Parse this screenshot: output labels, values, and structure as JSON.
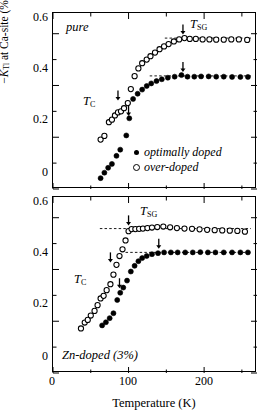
{
  "figure": {
    "ylabel_prefix": "−",
    "ylabel_k": "K",
    "ylabel_sub": "Tl",
    "ylabel_rest": " at Ca-site (%)",
    "xtitle": "Temperature (K)",
    "yticks": [
      "0",
      "0.2",
      "0.4",
      "0.6"
    ],
    "xticks": [
      "0",
      "100",
      "200"
    ],
    "legend": [
      {
        "marker": "filled-circle",
        "label": "optimally doped"
      },
      {
        "marker": "open-circle",
        "label": "over-doped"
      }
    ],
    "annotation_tc": "T",
    "annotation_tc_sub": "C",
    "annotation_tsg": "T",
    "annotation_tsg_sub": "SG"
  },
  "chart_data": [
    {
      "type": "scatter",
      "panel": "top",
      "title": "pure",
      "xlabel": "Temperature (K)",
      "ylabel": "-K_Tl at Ca-site (%)",
      "xlim": [
        0,
        270
      ],
      "ylim": [
        0,
        0.68
      ],
      "grid": false,
      "legend_position": "lower-right",
      "annotations": [
        {
          "text": "T_C",
          "series": "over-doped",
          "x": 86,
          "y": 0.33,
          "arrow": "down"
        },
        {
          "text": "T_C",
          "series": "optimally doped",
          "x": 100,
          "y": 0.27,
          "arrow": "down"
        },
        {
          "text": "T_SG",
          "series": "over-doped",
          "x": 172,
          "y": 0.585,
          "arrow": "down"
        },
        {
          "text": "T_SG",
          "series": "optimally doped",
          "x": 172,
          "y": 0.44,
          "arrow": "down"
        }
      ],
      "reference_lines": [
        {
          "series": "over-doped",
          "y": 0.583,
          "x_from": 148,
          "x_to": 262,
          "style": "dashed"
        },
        {
          "series": "optimally doped",
          "y": 0.437,
          "x_from": 128,
          "x_to": 262,
          "style": "dashed"
        }
      ],
      "series": [
        {
          "name": "optimally doped",
          "marker": "filled-circle",
          "points": [
            [
              63,
              0.042
            ],
            [
              68,
              0.063
            ],
            [
              73,
              0.082
            ],
            [
              78,
              0.097
            ],
            [
              84,
              0.128
            ],
            [
              89,
              0.152
            ],
            [
              97,
              0.207
            ],
            [
              101,
              0.273
            ],
            [
              106,
              0.348
            ],
            [
              112,
              0.368
            ],
            [
              118,
              0.384
            ],
            [
              124,
              0.398
            ],
            [
              130,
              0.408
            ],
            [
              137,
              0.417
            ],
            [
              144,
              0.424
            ],
            [
              152,
              0.43
            ],
            [
              161,
              0.434
            ],
            [
              170,
              0.44
            ],
            [
              178,
              0.434
            ],
            [
              187,
              0.434
            ],
            [
              196,
              0.435
            ],
            [
              206,
              0.435
            ],
            [
              216,
              0.434
            ],
            [
              226,
              0.434
            ],
            [
              237,
              0.433
            ],
            [
              248,
              0.433
            ],
            [
              258,
              0.433
            ]
          ]
        },
        {
          "name": "over-doped",
          "marker": "open-circle",
          "points": [
            [
              63,
              0.191
            ],
            [
              68,
              0.205
            ],
            [
              74,
              0.258
            ],
            [
              78,
              0.268
            ],
            [
              82,
              0.284
            ],
            [
              86,
              0.296
            ],
            [
              90,
              0.3
            ],
            [
              94,
              0.312
            ],
            [
              99,
              0.332
            ],
            [
              103,
              0.386
            ],
            [
              108,
              0.436
            ],
            [
              113,
              0.466
            ],
            [
              118,
              0.486
            ],
            [
              124,
              0.5
            ],
            [
              129,
              0.513
            ],
            [
              135,
              0.527
            ],
            [
              141,
              0.54
            ],
            [
              147,
              0.551
            ],
            [
              153,
              0.56
            ],
            [
              160,
              0.57
            ],
            [
              167,
              0.578
            ],
            [
              174,
              0.583
            ],
            [
              181,
              0.58
            ],
            [
              189,
              0.58
            ],
            [
              198,
              0.578
            ],
            [
              207,
              0.578
            ],
            [
              216,
              0.577
            ],
            [
              226,
              0.577
            ],
            [
              236,
              0.578
            ],
            [
              246,
              0.578
            ],
            [
              257,
              0.576
            ]
          ]
        }
      ]
    },
    {
      "type": "scatter",
      "panel": "bottom",
      "title": "Zn-doped (3%)",
      "xlabel": "Temperature (K)",
      "ylabel": "-K_Tl at Ca-site (%)",
      "xlim": [
        0,
        270
      ],
      "ylim": [
        0,
        0.68
      ],
      "grid": false,
      "legend_position": "none",
      "annotations": [
        {
          "text": "T_C",
          "series": "over-doped",
          "x": 76,
          "y": 0.415,
          "arrow": "down"
        },
        {
          "text": "T_C",
          "series": "optimally doped",
          "x": 88,
          "y": 0.315,
          "arrow": "down"
        },
        {
          "text": "T_SG",
          "series": "over-doped",
          "x": 100,
          "y": 0.558,
          "arrow": "down"
        },
        {
          "text": "T_SG",
          "series": "optimally doped",
          "x": 140,
          "y": 0.468,
          "arrow": "down"
        }
      ],
      "reference_lines": [
        {
          "series": "over-doped",
          "y": 0.558,
          "x_from": 62,
          "x_to": 262,
          "style": "dashed"
        },
        {
          "series": "optimally doped",
          "y": 0.466,
          "x_from": 96,
          "x_to": 262,
          "style": "dashed"
        }
      ],
      "series": [
        {
          "name": "optimally doped",
          "marker": "filled-circle",
          "points": [
            [
              65,
              0.184
            ],
            [
              70,
              0.196
            ],
            [
              75,
              0.212
            ],
            [
              80,
              0.231
            ],
            [
              85,
              0.282
            ],
            [
              89,
              0.31
            ],
            [
              93,
              0.33
            ],
            [
              98,
              0.357
            ],
            [
              103,
              0.392
            ],
            [
              108,
              0.414
            ],
            [
              113,
              0.432
            ],
            [
              118,
              0.444
            ],
            [
              124,
              0.452
            ],
            [
              131,
              0.459
            ],
            [
              139,
              0.463
            ],
            [
              147,
              0.466
            ],
            [
              156,
              0.466
            ],
            [
              165,
              0.466
            ],
            [
              175,
              0.466
            ],
            [
              185,
              0.466
            ],
            [
              195,
              0.467
            ],
            [
              205,
              0.466
            ],
            [
              215,
              0.466
            ],
            [
              226,
              0.466
            ],
            [
              237,
              0.466
            ],
            [
              248,
              0.466
            ],
            [
              258,
              0.466
            ]
          ]
        },
        {
          "name": "over-doped",
          "marker": "open-circle",
          "points": [
            [
              37,
              0.172
            ],
            [
              42,
              0.195
            ],
            [
              46,
              0.205
            ],
            [
              50,
              0.222
            ],
            [
              55,
              0.24
            ],
            [
              59,
              0.262
            ],
            [
              63,
              0.288
            ],
            [
              67,
              0.298
            ],
            [
              71,
              0.32
            ],
            [
              76,
              0.343
            ],
            [
              80,
              0.38
            ],
            [
              84,
              0.418
            ],
            [
              88,
              0.452
            ],
            [
              92,
              0.478
            ],
            [
              96,
              0.512
            ],
            [
              100,
              0.548
            ],
            [
              104,
              0.556
            ],
            [
              109,
              0.556
            ],
            [
              114,
              0.557
            ],
            [
              119,
              0.558
            ],
            [
              125,
              0.56
            ],
            [
              131,
              0.562
            ],
            [
              138,
              0.564
            ],
            [
              146,
              0.566
            ],
            [
              155,
              0.563
            ],
            [
              164,
              0.56
            ],
            [
              174,
              0.558
            ],
            [
              184,
              0.557
            ],
            [
              194,
              0.555
            ],
            [
              204,
              0.553
            ],
            [
              214,
              0.552
            ],
            [
              224,
              0.551
            ],
            [
              234,
              0.55
            ],
            [
              244,
              0.549
            ],
            [
              254,
              0.546
            ]
          ]
        }
      ]
    }
  ]
}
